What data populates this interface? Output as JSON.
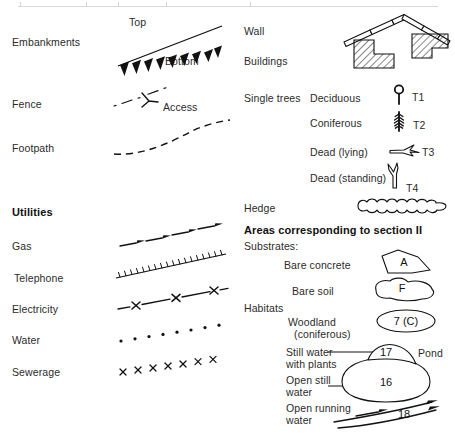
{
  "page": {
    "width": 455,
    "height": 437,
    "background": "#ffffff",
    "ink_color": "#111111",
    "text_color": "#2b2b2b"
  },
  "left_column": {
    "rows": [
      {
        "label": "Embankments",
        "symbol": "embankment-teeth-line"
      },
      {
        "label": "Fence",
        "symbol": "dash-dot-line-with-gate"
      },
      {
        "label": "Footpath",
        "symbol": "dashed-curved-line"
      }
    ],
    "embankment_annotations": {
      "top": "Top",
      "bottom": "Bottom"
    },
    "fence_annotation": "Access",
    "utilities": {
      "heading": "Utilities",
      "rows": [
        {
          "label": "Gas",
          "symbol": "arrow-dash-line"
        },
        {
          "label": "Telephone",
          "symbol": "comb-tick-line"
        },
        {
          "label": "Electricity",
          "symbol": "dash-x-line"
        },
        {
          "label": "Water",
          "symbol": "dotted-line"
        },
        {
          "label": "Sewerage",
          "symbol": "x-marks-line"
        }
      ]
    }
  },
  "right_column": {
    "rows": [
      {
        "label": "Wall",
        "symbol": "segmented-wall-line"
      },
      {
        "label": "Buildings",
        "symbol": "hatched-building-blocks"
      },
      {
        "label": "Hedge",
        "symbol": "bumpy-hedge-blob"
      }
    ],
    "single_trees": {
      "label": "Single trees",
      "items": [
        {
          "label": "Deciduous",
          "code": "T1",
          "symbol": "deciduous-tree-icon"
        },
        {
          "label": "Coniferous",
          "code": "T2",
          "symbol": "coniferous-tree-icon"
        },
        {
          "label": "Dead (lying)",
          "code": "T3",
          "symbol": "dead-lying-tree-icon"
        },
        {
          "label": "Dead (standing)",
          "code": "T4",
          "symbol": "dead-standing-tree-icon"
        }
      ]
    },
    "areas": {
      "heading": "Areas corresponding to section II",
      "substrates": {
        "label": "Substrates:",
        "items": [
          {
            "label": "Bare concrete",
            "code": "A",
            "symbol": "angular-polygon-patch"
          },
          {
            "label": "Bare soil",
            "code": "F",
            "symbol": "blob-patch"
          }
        ]
      },
      "habitats": {
        "label": "Habitats",
        "items": [
          {
            "label": "Woodland\n  (coniferous)",
            "code": "7 (C)",
            "symbol": "oval-patch"
          },
          {
            "label": "Still water\nwith plants",
            "code": "17",
            "symbol": "pond-upper-lobe",
            "callout": "Pond"
          },
          {
            "label": "Open still\nwater",
            "code": "16",
            "symbol": "pond-main-body"
          },
          {
            "label": "Open running\nwater",
            "code": "18",
            "symbol": "river-flow-arrows"
          }
        ]
      }
    }
  }
}
